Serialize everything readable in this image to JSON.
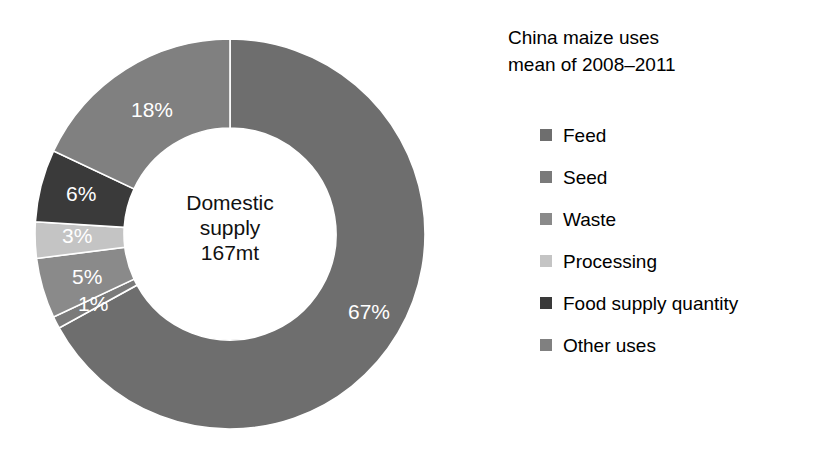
{
  "legend": {
    "title": "China maize uses\nmean of 2008–2011",
    "items": [
      {
        "label": "Feed",
        "color": "#6e6e6e"
      },
      {
        "label": "Seed",
        "color": "#7a7a7a"
      },
      {
        "label": "Waste",
        "color": "#8a8a8a"
      },
      {
        "label": "Processing",
        "color": "#c4c4c4"
      },
      {
        "label": "Food supply quantity",
        "color": "#3a3a3a"
      },
      {
        "label": "Other uses",
        "color": "#808080"
      }
    ]
  },
  "center": {
    "line1": "Domestic",
    "line2": "supply",
    "line3": "167mt"
  },
  "labels": {
    "feed": "67%",
    "seed": "1%",
    "waste": "5%",
    "processing": "3%",
    "food_supply_quantity": "6%",
    "other_uses": "18%"
  },
  "chart_data": {
    "type": "pie",
    "variant": "donut",
    "title": "China maize uses mean of 2008–2011",
    "center_text": "Domestic supply 167mt",
    "total_label": "167mt",
    "total_value": 167,
    "units": "mt",
    "start_angle_deg": 0,
    "direction": "clockwise",
    "inner_radius_ratio": 0.545,
    "legend_position": "right",
    "grid": false,
    "categories": [
      "Feed",
      "Seed",
      "Waste",
      "Processing",
      "Food supply quantity",
      "Other uses"
    ],
    "values": [
      67,
      1,
      5,
      3,
      6,
      18
    ],
    "value_labels": [
      "67%",
      "1%",
      "5%",
      "3%",
      "6%",
      "18%"
    ],
    "colors": [
      "#6e6e6e",
      "#7a7a7a",
      "#8a8a8a",
      "#c4c4c4",
      "#3a3a3a",
      "#808080"
    ],
    "xlabel": "",
    "ylabel": ""
  }
}
